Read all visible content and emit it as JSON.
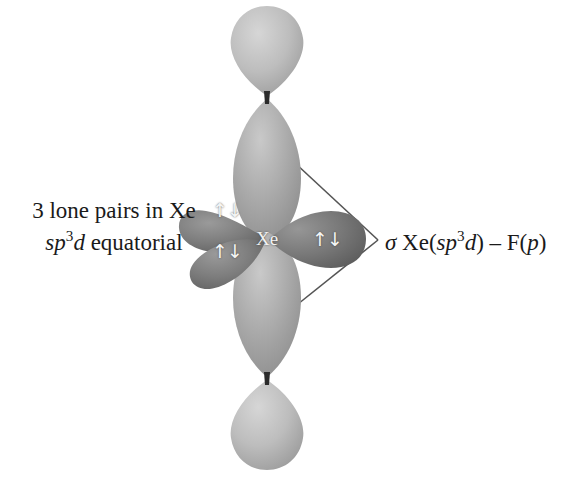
{
  "figure": {
    "background_color": "#ffffff"
  },
  "center_atom": {
    "symbol": "Xe",
    "label_color": "#f2f2f2"
  },
  "left_annotation": {
    "line1": "3 lone pairs in Xe",
    "line2_sp": "sp",
    "line2_exponent": "3",
    "line2_d": "d",
    "line2_rest": " equatorial"
  },
  "right_annotation": {
    "sigma": "σ",
    "xe_open": " Xe(",
    "sp": "sp",
    "exponent": "3",
    "d": "d",
    "close_dash": ") – F(",
    "p": "p",
    "end": ")"
  },
  "electron_pairs": [
    {
      "name": "upper-left-lone-pair",
      "glyph": "↑↓"
    },
    {
      "name": "lower-left-lone-pair",
      "glyph": "↑↓"
    },
    {
      "name": "right-lone-pair",
      "glyph": "↑↓"
    }
  ],
  "colors": {
    "lobe_light": "#b9b9b9",
    "lobe_mid": "#a3a3a3",
    "lobe_dark": "#7f7f7f",
    "lobe_darker": "#6e6e6e",
    "node": "#2b2b2b",
    "leader_line": "#555555",
    "text": "#1a1a1a"
  },
  "geometry": {
    "center_x": 267,
    "center_y": 240,
    "top_node_y": 97,
    "bottom_node_y": 379,
    "leader_apex_x": 378,
    "leader_apex_y": 240,
    "leader_top_origin": [
      295,
      163
    ],
    "leader_bottom_origin": [
      293,
      308
    ]
  }
}
